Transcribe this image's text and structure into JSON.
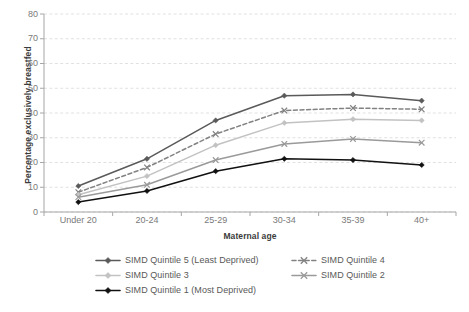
{
  "title_remnant": "",
  "axes": {
    "y_title": "Percentage exclusively breastfed",
    "x_title": "Maternal age"
  },
  "colors": {
    "quintile5": "#5a5a5a",
    "quintile4": "#828282",
    "quintile3": "#c2c2c2",
    "quintile2": "#9a9a9a",
    "quintile1": "#111111",
    "gridline": "#d9d9d9",
    "axis": "#a6a6a6",
    "tick_text": "#7a7a7a",
    "axis_title_text": "#3b3b3b"
  },
  "legend": {
    "items": [
      {
        "label": "SIMD Quintile 5 (Least Deprived)",
        "marker": "diamond-line-marker",
        "dash": false,
        "color": "#5a5a5a",
        "col": 0,
        "row": 0
      },
      {
        "label": "SIMD Quintile 4",
        "marker": "x-line-marker",
        "dash": true,
        "color": "#828282",
        "col": 1,
        "row": 0
      },
      {
        "label": "SIMD Quintile 3",
        "marker": "diamond-line-marker",
        "dash": false,
        "color": "#c2c2c2",
        "col": 0,
        "row": 1
      },
      {
        "label": "SIMD Quintile 2",
        "marker": "x-line-marker",
        "dash": false,
        "color": "#9a9a9a",
        "col": 1,
        "row": 1
      },
      {
        "label": "SIMD Quintile 1 (Most Deprived)",
        "marker": "diamond-line-marker",
        "dash": false,
        "color": "#111111",
        "col": 0,
        "row": 2
      }
    ]
  },
  "chart_data": {
    "type": "line",
    "title": "",
    "xlabel": "Maternal age",
    "ylabel": "Percentage exclusively breastfed",
    "categories": [
      "Under 20",
      "20-24",
      "25-29",
      "30-34",
      "35-39",
      "40+"
    ],
    "ylim": [
      0,
      80
    ],
    "yticks": [
      0,
      10,
      20,
      30,
      40,
      50,
      60,
      70,
      80
    ],
    "grid": true,
    "legend_position": "bottom",
    "series": [
      {
        "name": "SIMD Quintile 5 (Least Deprived)",
        "color": "#5a5a5a",
        "dash": false,
        "marker": "diamond",
        "values": [
          10.5,
          21.5,
          37,
          47,
          47.5,
          45
        ]
      },
      {
        "name": "SIMD Quintile 4",
        "color": "#828282",
        "dash": true,
        "marker": "x",
        "values": [
          8,
          18,
          31.5,
          41,
          42,
          41.5
        ]
      },
      {
        "name": "SIMD Quintile 3",
        "color": "#c2c2c2",
        "dash": false,
        "marker": "diamond",
        "values": [
          7,
          14.5,
          27,
          36,
          37.5,
          37
        ]
      },
      {
        "name": "SIMD Quintile 2",
        "color": "#9a9a9a",
        "dash": false,
        "marker": "x",
        "values": [
          6,
          11,
          21,
          27.5,
          29.5,
          28
        ]
      },
      {
        "name": "SIMD Quintile 1 (Most Deprived)",
        "color": "#111111",
        "dash": false,
        "marker": "diamond",
        "values": [
          4,
          8.5,
          16.5,
          21.5,
          21,
          19
        ]
      }
    ]
  }
}
